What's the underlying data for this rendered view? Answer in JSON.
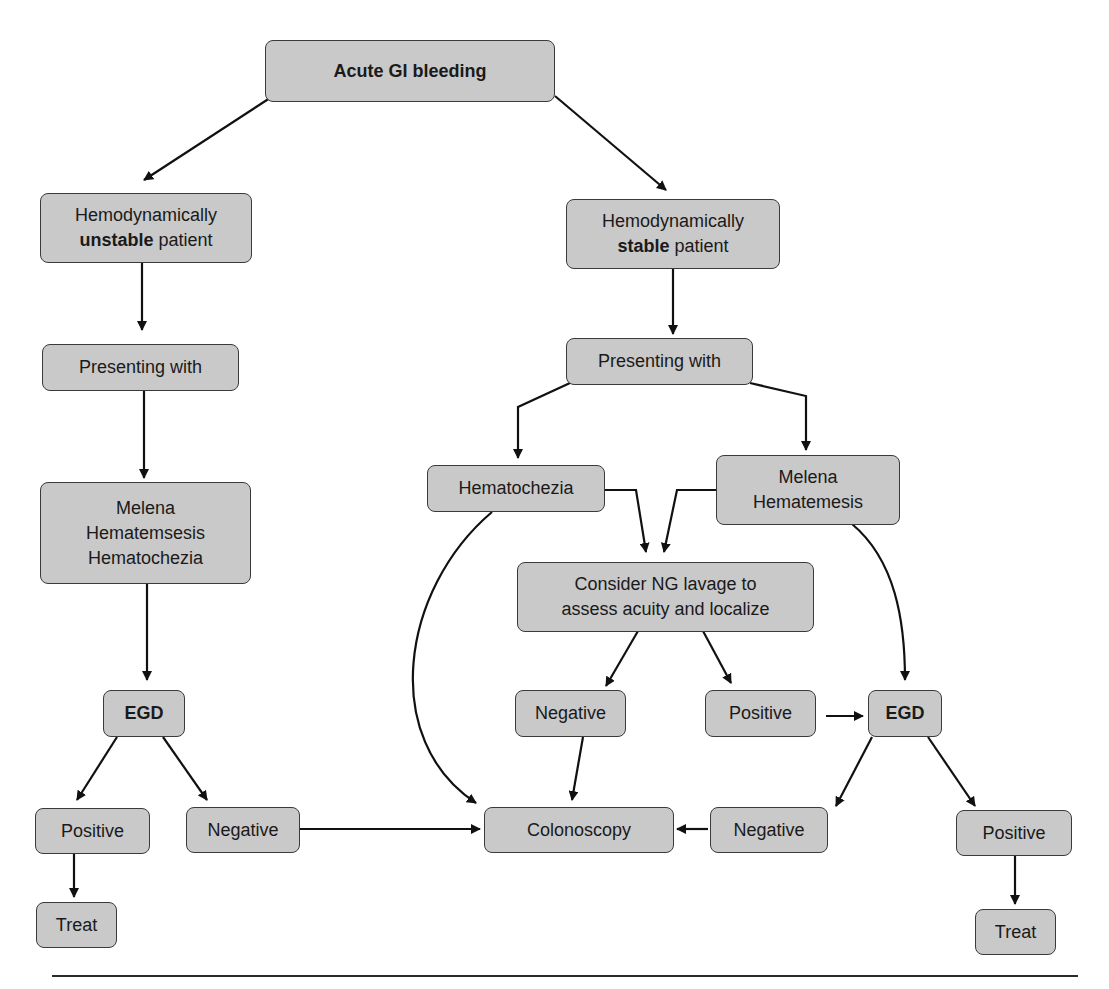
{
  "title": "Acute GI bleeding",
  "nodes": {
    "root": {
      "label": "Acute GI bleeding"
    },
    "unstable": {
      "line1": "Hemodynamically",
      "line2_bold": "unstable",
      "line2_rest": " patient"
    },
    "stable": {
      "line1": "Hemodynamically",
      "line2_bold": "stable",
      "line2_rest": " patient"
    },
    "unstable_presenting": {
      "label": "Presenting with"
    },
    "stable_presenting": {
      "label": "Presenting with"
    },
    "unstable_symptoms": {
      "lines": [
        "Melena",
        "Hematemsesis",
        "Hematochezia"
      ]
    },
    "hematochezia": {
      "label": "Hematochezia"
    },
    "melena_hematemesis": {
      "lines": [
        "Melena",
        "Hematemesis"
      ]
    },
    "ng_lavage": {
      "lines": [
        "Consider NG lavage to",
        "assess acuity and localize"
      ]
    },
    "unstable_egd": {
      "label": "EGD"
    },
    "lavage_negative": {
      "label": "Negative"
    },
    "lavage_positive": {
      "label": "Positive"
    },
    "stable_egd": {
      "label": "EGD"
    },
    "unstable_positive": {
      "label": "Positive"
    },
    "unstable_negative": {
      "label": "Negative"
    },
    "colonoscopy": {
      "label": "Colonoscopy"
    },
    "stable_egd_negative": {
      "label": "Negative"
    },
    "stable_egd_positive": {
      "label": "Positive"
    },
    "unstable_treat": {
      "label": "Treat"
    },
    "stable_treat": {
      "label": "Treat"
    }
  },
  "edges": [
    [
      "root",
      "unstable"
    ],
    [
      "root",
      "stable"
    ],
    [
      "unstable",
      "unstable_presenting"
    ],
    [
      "unstable_presenting",
      "unstable_symptoms"
    ],
    [
      "unstable_symptoms",
      "unstable_egd"
    ],
    [
      "unstable_egd",
      "unstable_positive"
    ],
    [
      "unstable_egd",
      "unstable_negative"
    ],
    [
      "unstable_positive",
      "unstable_treat"
    ],
    [
      "unstable_negative",
      "colonoscopy"
    ],
    [
      "stable",
      "stable_presenting"
    ],
    [
      "stable_presenting",
      "hematochezia"
    ],
    [
      "stable_presenting",
      "melena_hematemesis"
    ],
    [
      "hematochezia",
      "ng_lavage"
    ],
    [
      "melena_hematemesis",
      "ng_lavage"
    ],
    [
      "hematochezia",
      "colonoscopy"
    ],
    [
      "melena_hematemesis",
      "stable_egd"
    ],
    [
      "ng_lavage",
      "lavage_negative"
    ],
    [
      "ng_lavage",
      "lavage_positive"
    ],
    [
      "lavage_negative",
      "colonoscopy"
    ],
    [
      "lavage_positive",
      "stable_egd"
    ],
    [
      "stable_egd",
      "stable_egd_negative"
    ],
    [
      "stable_egd",
      "stable_egd_positive"
    ],
    [
      "stable_egd_negative",
      "colonoscopy"
    ],
    [
      "stable_egd_positive",
      "stable_treat"
    ]
  ],
  "colors": {
    "node_fill": "#c9c9c9",
    "node_border": "#3a3a3a",
    "line": "#111111"
  }
}
